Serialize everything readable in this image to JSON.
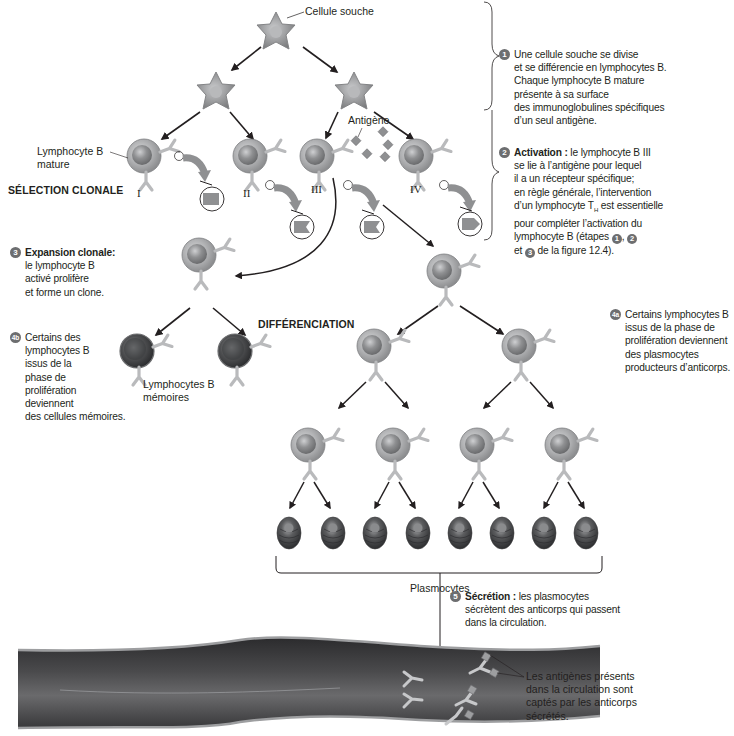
{
  "figure": {
    "labels": {
      "stem_cell": "Cellule souche",
      "mature_b_line1": "Lymphocyte B",
      "mature_b_line2": "mature",
      "clonal_selection": "SÉLECTION CLONALE",
      "antigen": "Antigène",
      "differentiation": "DIFFÉRENCIATION",
      "memory_b_line1": "Lymphocytes B",
      "memory_b_line2": "mémoires",
      "plasmocytes": "Plasmocytes",
      "roman_1": "I",
      "roman_2": "II",
      "roman_3": "III",
      "roman_4": "IV"
    },
    "steps": {
      "step1": {
        "badge": "1",
        "lines": [
          "Une cellule souche se divise",
          "et se différencie en lymphocytes B.",
          "Chaque lymphocyte B mature",
          "présente à sa surface",
          "des immunoglobulines spécifiques",
          "d’un seul antigène."
        ]
      },
      "step2": {
        "badge": "2",
        "title": "Activation :",
        "lines": [
          "le lymphocyte B III",
          "se lie à l’antigène pour lequel",
          "il a un récepteur spécifique;",
          "en règle générale, l’intervention",
          "d’un lymphocyte T",
          "est essentielle",
          "pour compléter l’activation du",
          "lymphocyte B (étapes",
          "et",
          "de la figure 12.4)."
        ],
        "subscript": "H",
        "ref_badges": [
          "1",
          "2",
          "3"
        ]
      },
      "step3": {
        "badge": "3",
        "title": "Expansion clonale:",
        "lines": [
          "le lymphocyte B",
          "activé prolifère",
          "et forme un clone."
        ]
      },
      "step4a": {
        "badge": "4a",
        "lines": [
          "Certains lymphocytes B",
          "issus de la phase de",
          "prolifération deviennent",
          "des plasmocytes",
          "producteurs d’anticorps."
        ]
      },
      "step4b": {
        "badge": "4b",
        "lines": [
          "Certains des",
          "lymphocytes B",
          "issus de la",
          "phase de",
          "prolifération",
          "deviennent",
          "des cellules mémoires."
        ]
      },
      "step5": {
        "badge": "5",
        "title": "Sécrétion :",
        "lines": [
          "les plasmocytes",
          "sécrètent des anticorps qui passent",
          "dans la circulation."
        ]
      },
      "circulation_note": {
        "lines": [
          "Les antigènes présents",
          "dans la circulation sont",
          "captés par les anticorps",
          "sécrétés."
        ]
      }
    },
    "colors": {
      "cell_fill": "#a7a9ac",
      "cell_nucleus": "#6d6e70",
      "memory_cell": "#58595b",
      "plasmocyte": "#4d4d4f",
      "arrow": "#231f20",
      "badge": "#6d6e70",
      "vessel": "#3a3a3c"
    }
  }
}
